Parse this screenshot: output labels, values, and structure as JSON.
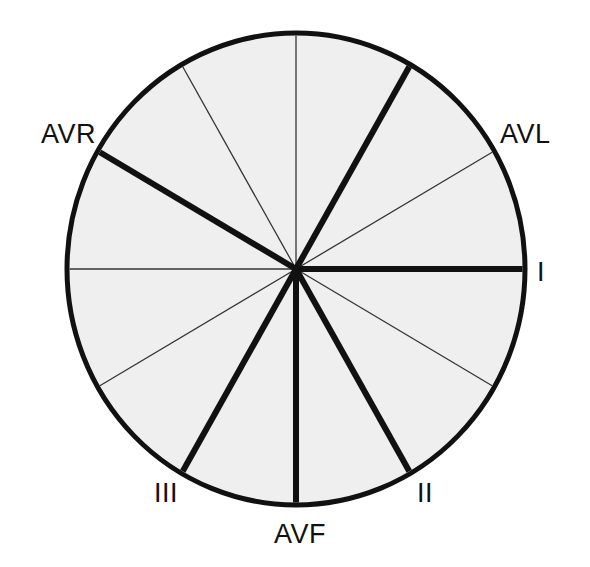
{
  "figure": {
    "background_color": "#ffffff",
    "circle": {
      "center_x": 296,
      "center_y": 269,
      "radius_x": 229,
      "radius_y": 236,
      "fill_color": "#efefef",
      "stroke_color": "#111111",
      "stroke_width": 5
    },
    "line_styles": {
      "lead_axis_color": "#111111",
      "lead_axis_width": 6,
      "minor_axis_color": "#333333",
      "minor_axis_width": 1.3
    }
  },
  "chart_data": {
    "type": "pie",
    "xlabel": "",
    "ylabel": "",
    "categories": [
      "I",
      "II",
      "III",
      "AVF",
      "AVL",
      "AVR"
    ],
    "values": [
      30,
      30,
      30,
      30,
      30,
      30
    ],
    "legend_position": "none",
    "grid": false,
    "axes": [
      {
        "name": "I",
        "angle_deg": 0,
        "style": "lead",
        "labeled": true,
        "label": "I"
      },
      {
        "name": "a30",
        "angle_deg": 30,
        "style": "minor",
        "labeled": false,
        "label": ""
      },
      {
        "name": "II",
        "angle_deg": 60,
        "style": "lead",
        "labeled": true,
        "label": "II"
      },
      {
        "name": "AVF",
        "angle_deg": 90,
        "style": "lead",
        "labeled": true,
        "label": "AVF"
      },
      {
        "name": "III",
        "angle_deg": 120,
        "style": "lead",
        "labeled": true,
        "label": "III"
      },
      {
        "name": "a150",
        "angle_deg": 150,
        "style": "minor",
        "labeled": false,
        "label": ""
      },
      {
        "name": "a180",
        "angle_deg": 180,
        "style": "minor",
        "labeled": false,
        "label": ""
      },
      {
        "name": "AVR",
        "angle_deg": 210,
        "style": "lead",
        "labeled": true,
        "label": "AVR"
      },
      {
        "name": "a240",
        "angle_deg": 240,
        "style": "minor",
        "labeled": false,
        "label": ""
      },
      {
        "name": "a270",
        "angle_deg": 270,
        "style": "minor",
        "labeled": false,
        "label": ""
      },
      {
        "name": "AVL",
        "angle_deg": 300,
        "style": "lead",
        "labeled": true,
        "label": "AVL"
      },
      {
        "name": "a330",
        "angle_deg": 330,
        "style": "minor",
        "labeled": false,
        "label": ""
      }
    ]
  },
  "labels": {
    "avr": "AVR",
    "avl": "AVL",
    "lead_i": "I",
    "lead_ii": "II",
    "lead_iii": "III",
    "avf": "AVF"
  }
}
